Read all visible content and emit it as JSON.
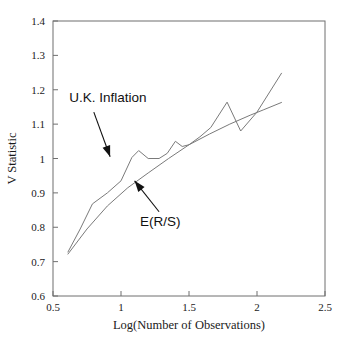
{
  "chart_data": {
    "type": "line",
    "title": "",
    "xlabel": "Log(Number of Observations)",
    "ylabel": "V Statistic",
    "xlim": [
      0.5,
      2.5
    ],
    "ylim": [
      0.6,
      1.4
    ],
    "xticks": [
      "0.5",
      "1",
      "1.5",
      "2",
      "2.5"
    ],
    "xtick_values": [
      0.5,
      1,
      1.5,
      2,
      2.5
    ],
    "yticks": [
      "0.6",
      "0.7",
      "0.8",
      "0.9",
      "1",
      "1.1",
      "1.2",
      "1.3",
      "1.4"
    ],
    "ytick_values": [
      0.6,
      0.7,
      0.8,
      0.9,
      1.0,
      1.1,
      1.2,
      1.3,
      1.4
    ],
    "grid": false,
    "legend": "inline-annotations",
    "series": [
      {
        "name": "U.K. Inflation",
        "label": "U.K. Inflation",
        "color": "#7a7a7a",
        "x": [
          0.61,
          0.7,
          0.79,
          0.9,
          1.0,
          1.08,
          1.13,
          1.2,
          1.28,
          1.34,
          1.4,
          1.45,
          1.5,
          1.58,
          1.66,
          1.78,
          1.88,
          2.0,
          2.18
        ],
        "y": [
          0.728,
          0.795,
          0.868,
          0.9,
          0.935,
          1.003,
          1.023,
          1.0,
          1.0,
          1.015,
          1.05,
          1.035,
          1.04,
          1.063,
          1.09,
          1.164,
          1.08,
          1.135,
          1.248
        ]
      },
      {
        "name": "E(R/S)",
        "label": "E(R/S)",
        "color": "#7a7a7a",
        "x": [
          0.61,
          0.75,
          0.9,
          1.05,
          1.2,
          1.35,
          1.5,
          1.65,
          1.8,
          1.95,
          2.05,
          2.18
        ],
        "y": [
          0.722,
          0.795,
          0.862,
          0.915,
          0.958,
          1.0,
          1.04,
          1.071,
          1.1,
          1.126,
          1.142,
          1.163
        ]
      }
    ],
    "annotations": [
      {
        "text": "U.K. Inflation",
        "label_x": 0.62,
        "label_y": 1.165,
        "arrow_from_x": 0.8,
        "arrow_from_y": 1.135,
        "arrow_to_x": 0.92,
        "arrow_to_y": 1.005
      },
      {
        "text": "E(R/S)",
        "label_x": 1.14,
        "label_y": 0.805,
        "arrow_from_x": 1.28,
        "arrow_from_y": 0.845,
        "arrow_to_x": 1.1,
        "arrow_to_y": 0.935
      }
    ]
  }
}
